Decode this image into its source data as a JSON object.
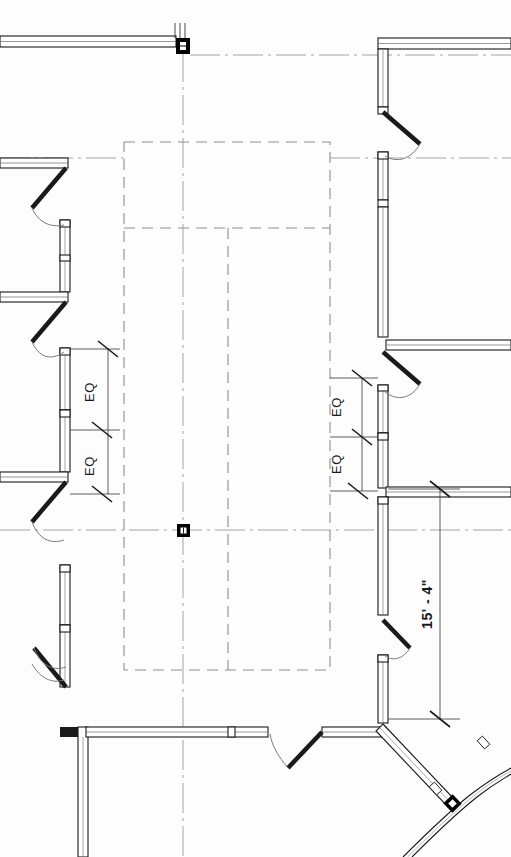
{
  "drawing": {
    "type": "architectural-floor-plan",
    "title": "Partial Floor Plan",
    "background_color": "#fdfdfd",
    "line_color": "#1a1a1a",
    "gridline_color": "#9a9a9a",
    "dashed_overhead_color": "#8f8f8f",
    "column_fill": "#000000",
    "canvas": {
      "width": 511,
      "height": 857
    }
  },
  "dimensions": {
    "left_string": {
      "label_top": "EQ",
      "label_bottom": "EQ",
      "extension_x": 100,
      "ticks_y": [
        349,
        430,
        494
      ],
      "text_top": "EQ",
      "text_bottom": "EQ"
    },
    "right_string": {
      "label_top": "EQ",
      "label_bottom": "EQ",
      "extension_x": 362,
      "ticks_y": [
        378,
        437,
        491
      ],
      "text_top": "EQ",
      "text_bottom": "EQ"
    },
    "vertical_overall": {
      "label": "15' - 4\"",
      "line_x": 440,
      "tick_top_y": 489,
      "tick_bottom_y": 719
    }
  },
  "annotations": [
    {
      "name": "eq-left-upper",
      "text": "EQ",
      "x": 94,
      "y": 392
    },
    {
      "name": "eq-left-lower",
      "text": "EQ",
      "x": 94,
      "y": 462
    },
    {
      "name": "eq-right-upper",
      "text": "EQ",
      "x": 340,
      "y": 407
    },
    {
      "name": "eq-right-lower",
      "text": "EQ",
      "x": 340,
      "y": 464
    },
    {
      "name": "overall-vertical-dimension",
      "text": "15' - 4\"",
      "x": 434,
      "y": 604
    }
  ],
  "columns": [
    {
      "name": "column-grid-top",
      "x": 183,
      "y": 45,
      "size": 13
    },
    {
      "name": "column-grid-center",
      "x": 183,
      "y": 530,
      "size": 12
    },
    {
      "name": "column-grid-southeast",
      "x": 452,
      "y": 803,
      "size": 12
    }
  ],
  "gridlines": {
    "vertical": [
      183
    ],
    "horizontal": [
      530
    ],
    "style": "dash-dot"
  },
  "overhead_outline": {
    "name": "dashed-overhead-rectangle",
    "x": 124,
    "y": 142,
    "width": 206,
    "height": 528,
    "interior_lines": [
      {
        "orientation": "horizontal",
        "y": 228
      },
      {
        "orientation": "vertical",
        "x": 228,
        "from": 228,
        "to": 670
      }
    ]
  },
  "legend": {
    "wall_label": "wall",
    "door_label": "door-swing",
    "column_label": "structural-column",
    "grid_label": "grid-line",
    "overhead_label": "overhead-dashed"
  }
}
